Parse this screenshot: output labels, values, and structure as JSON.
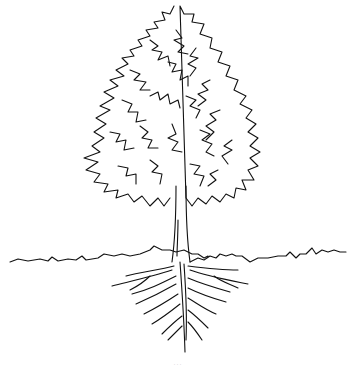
{
  "illustration": {
    "subject": "tree with root system",
    "style": "black line drawing on white",
    "parts": [
      "canopy",
      "trunk",
      "ground-line",
      "roots",
      "taproot"
    ],
    "colors": {
      "ink": "#111111",
      "background": "#ffffff"
    }
  },
  "caption": {
    "text": "···"
  }
}
